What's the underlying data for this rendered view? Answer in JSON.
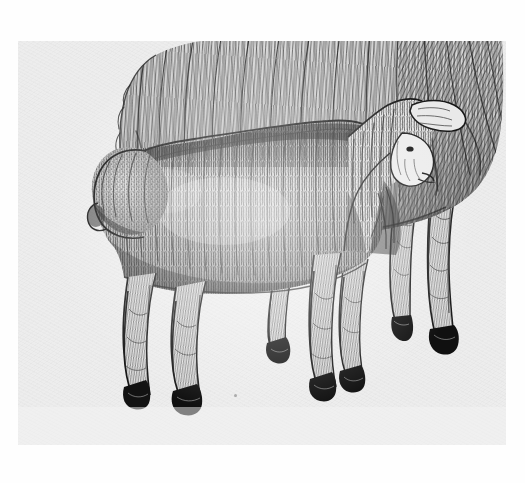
{
  "artwork": {
    "title": "Lamb and Ewe",
    "medium": "pen-and-ink drawing",
    "technique": "hatching and stippling",
    "subject": "A young lamb standing in front of a full-fleeced adult sheep",
    "signature": "",
    "caption": ""
  },
  "canvas": {
    "width": 525,
    "height": 483,
    "outer_background": "#fefefe",
    "panel_background": "#ededed",
    "panel_left": 18,
    "panel_top": 41,
    "panel_width": 488,
    "panel_height": 404
  },
  "palette": {
    "paper": "#ededed",
    "paper_highlight": "#f7f7f7",
    "ink_light": "#8d8d8d",
    "ink_mid": "#4a4a4a",
    "ink_dark": "#2a2a2a",
    "ink_black": "#141414",
    "margin_white": "#fefefe"
  },
  "figures": [
    {
      "name": "adult-sheep",
      "role": "background animal",
      "description": "Heavy-fleeced ewe seen from the side, body filling the upper portion, two hind legs visible at right with dark hooves",
      "fleece_texture": "long flowing vertical strokes",
      "legs_visible": 2,
      "hooves": 2
    },
    {
      "name": "lamb",
      "role": "foreground animal",
      "description": "Young lamb standing broadside, head turned to the right toward the ewe, short curly fleece rendered in dense vertical hatching, four legs with small dark hooves",
      "fleece_texture": "short dense curled hatching and stipple",
      "legs_visible": 4,
      "hooves": 4,
      "head_direction": "right",
      "ear": "one ear extended to the right"
    }
  ],
  "details": {
    "ground_shadow": "none",
    "paper_speck_visible": true,
    "border_style": "white margin around light grey scan panel"
  }
}
